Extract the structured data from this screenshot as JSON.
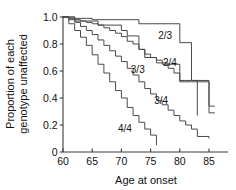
{
  "chart_data": {
    "type": "line",
    "title": "",
    "subtitle": "",
    "xlabel": "Age at onset",
    "ylabel": "Proportion of each genotype unaffected",
    "ylabel_line1": "Proportion of each",
    "ylabel_line2": "genotype unaffected",
    "xlim": [
      60,
      88
    ],
    "ylim": [
      0,
      1.0
    ],
    "xticks": [
      60,
      65,
      70,
      75,
      80,
      85
    ],
    "xtick_labels": [
      "60",
      "65",
      "70",
      "75",
      "80",
      "85"
    ],
    "yticks": [
      0,
      0.2,
      0.4,
      0.6,
      0.8,
      1.0
    ],
    "ytick_labels": [
      "0",
      "0.2",
      "0.4",
      "0.6",
      "0.8",
      "1.0"
    ],
    "grid": false,
    "legend": "inline-annotations",
    "curve_style": "kaplan-meier step (post)",
    "series": [
      {
        "name": "2/3",
        "label": "2/3",
        "label_x": 77.5,
        "label_y": 0.84,
        "color": "#4a4a4a",
        "x": [
          60,
          61,
          62,
          64,
          65,
          70,
          73,
          74,
          79,
          80,
          82,
          85,
          86
        ],
        "y": [
          1.0,
          1.0,
          0.99,
          0.99,
          0.98,
          0.98,
          0.95,
          0.95,
          0.95,
          0.81,
          0.53,
          0.34,
          0.34
        ]
      },
      {
        "name": "2/4",
        "label": "2/4",
        "label_x": 78.3,
        "label_y": 0.64,
        "color": "#4a4a4a",
        "x": [
          60,
          62,
          65,
          66,
          69,
          70,
          71,
          72,
          73,
          74,
          76,
          78,
          80,
          82,
          85,
          86
        ],
        "y": [
          1.0,
          0.97,
          0.97,
          0.94,
          0.94,
          0.9,
          0.86,
          0.86,
          0.76,
          0.7,
          0.66,
          0.65,
          0.52,
          0.52,
          0.29,
          0.29
        ]
      },
      {
        "name": "3/3",
        "label": "3/3",
        "label_x": 72.8,
        "label_y": 0.585,
        "color": "#4a4a4a",
        "x": [
          60,
          61,
          62,
          63,
          64,
          65,
          66,
          67,
          68,
          69,
          70,
          71,
          72,
          73,
          74,
          75,
          76,
          77,
          78,
          79,
          80,
          81,
          82,
          83
        ],
        "y": [
          1.0,
          0.99,
          0.98,
          0.97,
          0.96,
          0.95,
          0.94,
          0.92,
          0.9,
          0.88,
          0.855,
          0.82,
          0.8,
          0.76,
          0.725,
          0.7,
          0.68,
          0.65,
          0.62,
          0.585,
          0.53,
          0.53,
          0.53,
          0.27
        ]
      },
      {
        "name": "3/4",
        "label": "3/4",
        "label_x": 76.8,
        "label_y": 0.355,
        "color": "#4a4a4a",
        "x": [
          60,
          61,
          62,
          63,
          64,
          65,
          66,
          67,
          68,
          69,
          70,
          71,
          72,
          73,
          74,
          75,
          76,
          77,
          78,
          79,
          80,
          81,
          82,
          83,
          85
        ],
        "y": [
          1.0,
          0.98,
          0.96,
          0.93,
          0.9,
          0.87,
          0.83,
          0.79,
          0.75,
          0.71,
          0.67,
          0.62,
          0.57,
          0.52,
          0.47,
          0.43,
          0.38,
          0.35,
          0.31,
          0.27,
          0.23,
          0.2,
          0.17,
          0.115,
          0.1
        ]
      },
      {
        "name": "4/4",
        "label": "4/4",
        "label_x": 70.6,
        "label_y": 0.145,
        "color": "#4a4a4a",
        "x": [
          60,
          61,
          62,
          63,
          64,
          65,
          66,
          67,
          68,
          69,
          70,
          71,
          72,
          73,
          74,
          75,
          76
        ],
        "y": [
          1.0,
          0.95,
          0.9,
          0.85,
          0.79,
          0.72,
          0.65,
          0.585,
          0.52,
          0.455,
          0.4,
          0.33,
          0.27,
          0.22,
          0.17,
          0.125,
          0.05
        ]
      }
    ]
  }
}
